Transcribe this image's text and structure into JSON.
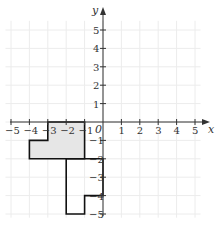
{
  "diagram": {
    "type": "coordinate-grid",
    "x_axis": {
      "label": "x",
      "min": -5,
      "max": 5,
      "ticks": [
        "−5",
        "−4",
        "−3",
        "−2",
        "−1",
        "1",
        "2",
        "3",
        "4",
        "5"
      ]
    },
    "y_axis": {
      "label": "y",
      "min": -5,
      "max": 5,
      "ticks_pos": [
        "5",
        "4",
        "3",
        "2",
        "1"
      ],
      "ticks_neg": [
        "−1",
        "−2",
        "−3",
        "−4",
        "−5"
      ]
    },
    "origin_label": "0",
    "colors": {
      "grid": "#ececec",
      "axis": "#333333",
      "shape_stroke": "#111111",
      "shaded_fill": "#e6e6e6"
    },
    "shapes": [
      {
        "name": "shaded-shape",
        "fill": true,
        "vertices": [
          [
            -3,
            0
          ],
          [
            -1,
            0
          ],
          [
            -1,
            -2
          ],
          [
            -4,
            -2
          ],
          [
            -4,
            -1
          ],
          [
            -3,
            -1
          ]
        ]
      },
      {
        "name": "outline-shape",
        "fill": false,
        "vertices": [
          [
            -2,
            -2
          ],
          [
            -2,
            -5
          ],
          [
            -1,
            -5
          ],
          [
            -1,
            -4
          ],
          [
            0,
            -4
          ],
          [
            0,
            -2
          ]
        ]
      }
    ]
  }
}
